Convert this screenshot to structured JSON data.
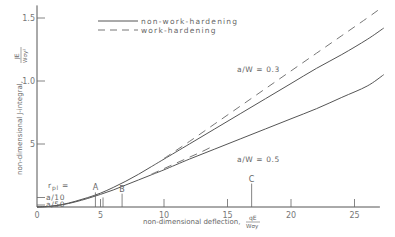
{
  "chart_data": {
    "type": "line",
    "title": "",
    "xlabel": "non-dimensional deflection, qE/(Wσy)",
    "xlabel_text": "non-dimensional deflection,",
    "xlabel_frac_num": "qE",
    "xlabel_frac_den": "Wσy",
    "ylabel": "non-dimensional J-integral, JE/(Wσy²)",
    "ylabel_text": "non-dimensional J-integral,",
    "ylabel_frac_num": "JE",
    "ylabel_frac_den": "Wσy²",
    "xlim": [
      0,
      27
    ],
    "ylim": [
      0,
      16
    ],
    "grid": false,
    "x_ticks": [
      0,
      5,
      10,
      15,
      20,
      25
    ],
    "x_tick_labels": [
      "0",
      "5",
      "10",
      "15",
      "20",
      "25"
    ],
    "y_ticks": [
      5,
      10,
      15
    ],
    "y_tick_labels": [
      "5",
      "1.0",
      "1.5"
    ],
    "legend": {
      "placement": "top-center",
      "entries": [
        {
          "label": "non-work-hardening",
          "style": "solid"
        },
        {
          "label": "work-hardening",
          "style": "dashed"
        }
      ]
    },
    "series": [
      {
        "name": "a/W = 0.3 non-work-hardening",
        "style": "solid",
        "x": [
          0,
          1,
          2,
          3,
          4,
          5,
          6,
          7,
          8,
          9,
          10,
          12,
          14,
          16,
          18,
          20,
          22,
          24,
          26,
          27.3
        ],
        "y": [
          0,
          0.05,
          0.2,
          0.45,
          0.75,
          1.1,
          1.55,
          2.05,
          2.6,
          3.2,
          3.8,
          5.0,
          6.2,
          7.4,
          8.6,
          9.8,
          11.0,
          12.1,
          13.3,
          14.2
        ]
      },
      {
        "name": "a/W = 0.3 work-hardening",
        "style": "dashed",
        "x": [
          10,
          12,
          14,
          16,
          18,
          20,
          22,
          24,
          26,
          27.1
        ],
        "y": [
          3.85,
          5.2,
          6.6,
          8.0,
          9.4,
          10.8,
          12.2,
          13.6,
          15.0,
          15.8
        ]
      },
      {
        "name": "a/W = 0.5 non-work-hardening",
        "style": "solid",
        "x": [
          0,
          1,
          2,
          3,
          4,
          5,
          6,
          7,
          8,
          9,
          10,
          12,
          14,
          16,
          18,
          20,
          22,
          24,
          26,
          27.3
        ],
        "y": [
          0,
          0.05,
          0.18,
          0.4,
          0.68,
          1.0,
          1.35,
          1.75,
          2.15,
          2.55,
          2.95,
          3.8,
          4.6,
          5.4,
          6.2,
          7.0,
          7.8,
          8.7,
          9.6,
          10.5
        ]
      },
      {
        "name": "a/W = 0.5 work-hardening",
        "style": "dashed",
        "x": [
          9,
          10,
          11,
          12,
          13,
          14
        ],
        "y": [
          2.6,
          3.05,
          3.5,
          3.95,
          4.4,
          4.9
        ]
      }
    ],
    "annotations": [
      {
        "text": "a/W = 0.3",
        "x": 16.5,
        "y": 10.8
      },
      {
        "text": "a/W = 0.5",
        "x": 16.5,
        "y": 3.7
      },
      {
        "text": "r",
        "x": 0.6,
        "y": 1.6
      },
      {
        "text": "pl",
        "x": 0.9,
        "y": 1.5
      },
      {
        "text": "=",
        "x": 1.7,
        "y": 1.6
      },
      {
        "text": "a/10",
        "x": 1.1,
        "y": 0.9
      },
      {
        "text": "a/50",
        "x": 1.1,
        "y": 0.3
      }
    ],
    "markers": [
      {
        "label": "A",
        "x": 4.6,
        "y_top": 1.0
      },
      {
        "label": "B",
        "x": 6.7,
        "y_top": 0.9
      },
      {
        "label": "C",
        "x": 16.9,
        "y_top": 1.7
      }
    ],
    "extra_ticks": [
      {
        "x": 5.2,
        "y_top": 0.6
      }
    ],
    "rpl_ticks": [
      {
        "label": "a/10",
        "y": 0.75
      },
      {
        "label": "a/50",
        "y": 0.15
      }
    ]
  }
}
